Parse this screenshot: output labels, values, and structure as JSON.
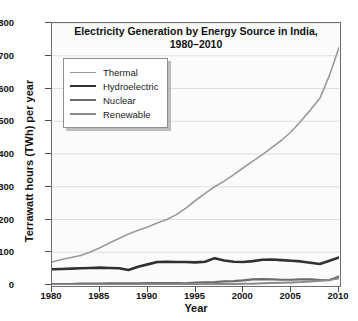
{
  "chart_data": {
    "type": "line",
    "title": "Electricity Generation by Energy Source in India, 1980–2010",
    "title_line1": "Electricity Generation by Energy Source in India,",
    "title_line2": "1980–2010",
    "xlabel": "Year",
    "ylabel": "Terrawatt hours (TWh) per year",
    "xlim": [
      1980,
      2010
    ],
    "ylim": [
      0,
      800
    ],
    "ytick_labels": [
      "0",
      "100",
      "200",
      "300",
      "400",
      "500",
      "600",
      "700",
      "800"
    ],
    "ytick_values": [
      0,
      100,
      200,
      300,
      400,
      500,
      600,
      700,
      800
    ],
    "xtick_labels": [
      "1980",
      "1985",
      "1990",
      "1995",
      "2000",
      "2005",
      "2010"
    ],
    "xtick_values": [
      1980,
      1985,
      1990,
      1995,
      2000,
      2005,
      2010
    ],
    "grid": true,
    "grid_axis": "y",
    "legend_position": "upper left",
    "x": [
      1980,
      1981,
      1982,
      1983,
      1984,
      1985,
      1986,
      1987,
      1988,
      1989,
      1990,
      1991,
      1992,
      1993,
      1994,
      1995,
      1996,
      1997,
      1998,
      1999,
      2000,
      2001,
      2002,
      2003,
      2004,
      2005,
      2006,
      2007,
      2008,
      2009,
      2010
    ],
    "series": [
      {
        "name": "Thermal",
        "color": "#9a9a9a",
        "width": 1.6,
        "values": [
          70,
          78,
          84,
          90,
          101,
          114,
          128,
          142,
          156,
          167,
          177,
          189,
          200,
          215,
          235,
          258,
          280,
          300,
          317,
          337,
          358,
          378,
          398,
          420,
          442,
          468,
          500,
          534,
          570,
          640,
          725
        ]
      },
      {
        "name": "Hydroelectric",
        "color": "#303030",
        "width": 2.6,
        "values": [
          48,
          49,
          50,
          51,
          52,
          53,
          52,
          51,
          46,
          56,
          63,
          70,
          71,
          70,
          70,
          69,
          71,
          82,
          75,
          71,
          70,
          73,
          77,
          78,
          76,
          74,
          72,
          68,
          64,
          74,
          84
        ]
      },
      {
        "name": "Nuclear",
        "color": "#6b6b6b",
        "width": 2.2,
        "values": [
          3,
          3,
          3,
          4,
          4,
          4,
          5,
          5,
          5,
          5,
          6,
          6,
          6,
          6,
          5,
          7,
          8,
          9,
          11,
          12,
          14,
          17,
          18,
          17,
          16,
          16,
          17,
          17,
          15,
          15,
          26
        ]
      },
      {
        "name": "Renewable",
        "color": "#8a8a8a",
        "width": 2.0,
        "values": [
          1,
          1,
          1,
          1,
          1,
          1,
          1,
          1,
          1,
          1,
          2,
          2,
          2,
          2,
          2,
          2,
          2,
          3,
          3,
          3,
          4,
          4,
          5,
          6,
          7,
          8,
          9,
          11,
          13,
          16,
          20
        ]
      }
    ]
  },
  "legend": {
    "items": [
      {
        "label": "Thermal"
      },
      {
        "label": "Hydroelectric"
      },
      {
        "label": "Nuclear"
      },
      {
        "label": "Renewable"
      }
    ]
  }
}
